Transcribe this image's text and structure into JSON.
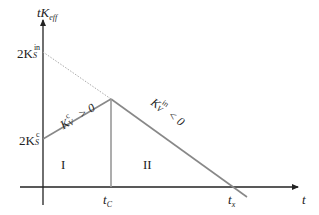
{
  "diagram": {
    "y_axis": {
      "label_main": "tK",
      "label_sub": "eff"
    },
    "x_axis": {
      "label": "t"
    },
    "y_ticks": [
      {
        "main": "2K",
        "sup": "in",
        "sub": "S"
      },
      {
        "main": "2K",
        "sup": "c",
        "sub": "S"
      }
    ],
    "x_ticks": [
      {
        "main": "t",
        "sub": "C"
      },
      {
        "main": "t",
        "sub": "x"
      }
    ],
    "regions": {
      "left": "I",
      "right": "II"
    },
    "line_labels": {
      "rising": {
        "main": "K",
        "sub": "V",
        "sup": "c",
        "rel": " > 0"
      },
      "falling": {
        "main": "K",
        "sub": "V",
        "sup": "in",
        "rel": " < 0"
      }
    },
    "colors": {
      "axis": "#222222",
      "line": "#888888",
      "dotted": "#aaaaaa"
    }
  }
}
